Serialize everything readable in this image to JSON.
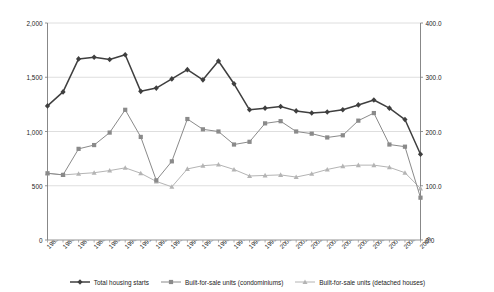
{
  "chart_data": {
    "type": "line",
    "title": "",
    "xlabel": "",
    "ylabel": "Total Housing Starts (in 1,000 units)",
    "y2label": "Built-for-Sale Units (in 1,000 units)",
    "grid": true,
    "legend_position": "bottom",
    "ylim": [
      0,
      2000
    ],
    "y2lim": [
      0.0,
      400.0
    ],
    "yticks": [
      "0",
      "500",
      "1,000",
      "1,500",
      "2,000"
    ],
    "ytick_values": [
      0,
      500,
      1000,
      1500,
      2000
    ],
    "y2ticks": [
      "0.0",
      "100.0",
      "200.0",
      "300.0",
      "400.0"
    ],
    "y2tick_values": [
      0,
      100,
      200,
      300,
      400
    ],
    "categories": [
      "1985",
      "1986",
      "1987",
      "1988",
      "1989",
      "1990",
      "1991",
      "1992",
      "1993",
      "1994",
      "1995",
      "1996",
      "1997",
      "1998",
      "1999",
      "2000",
      "2001",
      "2002",
      "2003",
      "2004",
      "2005",
      "2006",
      "2007",
      "2008",
      "2009"
    ],
    "series": [
      {
        "name": "Total housing starts",
        "axis": "left",
        "color": "#3f3f3f",
        "marker": "diamond",
        "values": [
          1236,
          1365,
          1669,
          1685,
          1663,
          1707,
          1370,
          1400,
          1485,
          1570,
          1476,
          1650,
          1440,
          1200,
          1215,
          1230,
          1190,
          1170,
          1180,
          1200,
          1245,
          1290,
          1215,
          1110,
          790
        ]
      },
      {
        "name": "Built-for-sale units (condominiums)",
        "axis": "right",
        "color": "#8a8a8a",
        "marker": "square",
        "values": [
          123,
          120,
          168,
          175,
          198,
          240,
          190,
          110,
          145,
          223,
          204,
          200,
          176,
          181,
          215,
          219,
          200,
          196,
          189,
          193,
          220,
          234,
          176,
          172,
          78
        ]
      },
      {
        "name": "Built-for-sale units (detached houses)",
        "axis": "right",
        "color": "#b4b4b4",
        "marker": "triangle",
        "values": [
          123,
          120,
          122,
          124,
          128,
          133,
          123,
          108,
          98,
          131,
          137,
          139,
          130,
          118,
          119,
          120,
          116,
          122,
          130,
          136,
          138,
          138,
          134,
          124,
          95
        ]
      }
    ]
  },
  "legend": {
    "items": [
      {
        "label": "Total housing starts"
      },
      {
        "label": "Built-for-sale units (condominiums)"
      },
      {
        "label": "Built-for-sale units (detached houses)"
      }
    ]
  }
}
